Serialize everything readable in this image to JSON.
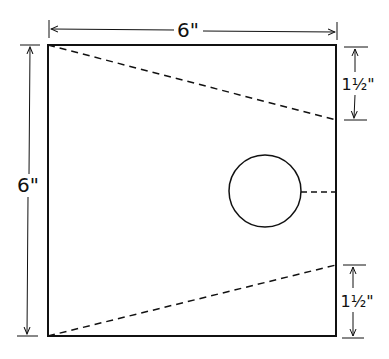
{
  "diagram": {
    "type": "dimensioned-template",
    "colors": {
      "stroke": "#111111",
      "background": "#ffffff"
    },
    "labels": {
      "top_width": "6\"",
      "left_height": "6\"",
      "right_top_offset": "1½\"",
      "right_bottom_offset": "1½\""
    },
    "shapes": {
      "square": {
        "x": 48,
        "y": 45,
        "w": 288,
        "h": 291
      },
      "hole": {
        "cx": 265,
        "cy": 191,
        "r": 36
      },
      "upper_fold_line": {
        "x1": 48,
        "y1": 45,
        "x2": 336,
        "y2": 120
      },
      "lower_fold_line": {
        "x1": 48,
        "y1": 336,
        "x2": 336,
        "y2": 265
      },
      "hole_center_line": {
        "x1": 301,
        "y1": 192,
        "x2": 336,
        "y2": 192
      }
    }
  }
}
